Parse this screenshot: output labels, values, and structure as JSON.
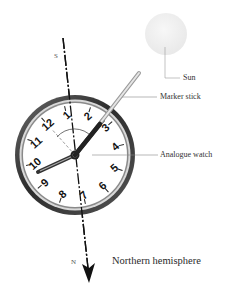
{
  "diagram": {
    "labels": {
      "sun": "Sun",
      "marker_stick": "Marker stick",
      "analogue_watch": "Analogue watch",
      "hemisphere": "Northern hemisphere",
      "south": "S",
      "north": "N"
    },
    "watch": {
      "numerals": [
        "12",
        "1",
        "2",
        "3",
        "4",
        "5",
        "6",
        "7",
        "8",
        "9",
        "10",
        "11"
      ],
      "hour_hand_points_to": "3",
      "minute_hand_points_to": "10",
      "dial_rotation_deg": -42
    },
    "colors": {
      "sun": "#efefef",
      "bezel": "#3a3a3a",
      "bezel_highlight": "#bfbfbf",
      "stick": "#d8d8d8",
      "leader_lines": "#777777",
      "axis": "#111111"
    }
  }
}
